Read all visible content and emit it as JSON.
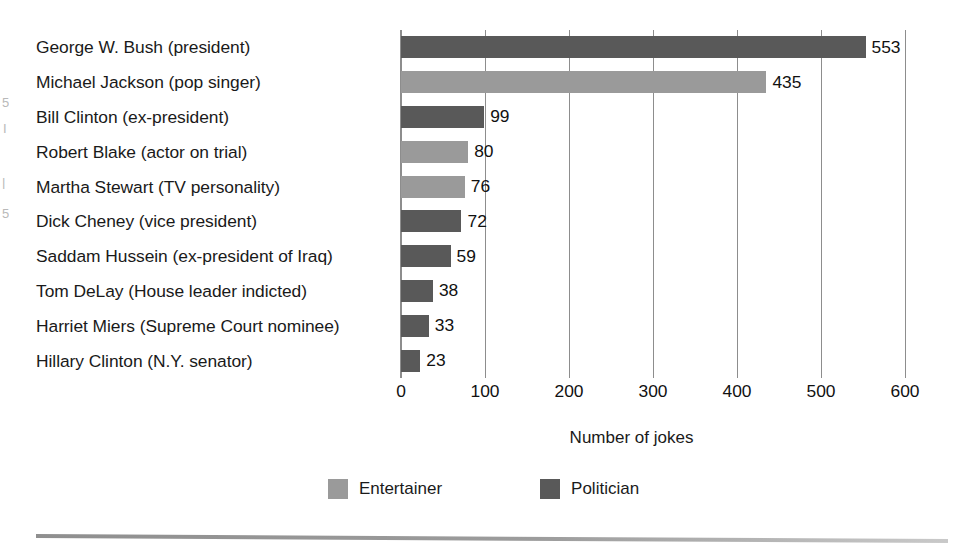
{
  "chart_data": {
    "type": "bar",
    "orientation": "horizontal",
    "title": "",
    "xlabel": "Number of jokes",
    "ylabel": "",
    "xlim": [
      0,
      600
    ],
    "xticks": [
      0,
      100,
      200,
      300,
      400,
      500,
      600
    ],
    "grid": true,
    "legend_position": "bottom-center",
    "categories": [
      "George W. Bush (president)",
      "Michael Jackson (pop singer)",
      "Bill Clinton (ex-president)",
      "Robert Blake (actor on trial)",
      "Martha Stewart (TV personality)",
      "Dick Cheney (vice president)",
      "Saddam Hussein (ex-president of Iraq)",
      "Tom DeLay (House leader indicted)",
      "Harriet Miers (Supreme Court nominee)",
      "Hillary Clinton (N.Y. senator)"
    ],
    "values": [
      553,
      435,
      99,
      80,
      76,
      72,
      59,
      38,
      33,
      23
    ],
    "groups": [
      "Politician",
      "Entertainer",
      "Politician",
      "Entertainer",
      "Entertainer",
      "Politician",
      "Politician",
      "Politician",
      "Politician",
      "Politician"
    ],
    "bars": [
      {
        "label": "George W. Bush (president)",
        "value": 553,
        "value_text": "553",
        "group": "Politician"
      },
      {
        "label": "Michael Jackson (pop singer)",
        "value": 435,
        "value_text": "435",
        "group": "Entertainer"
      },
      {
        "label": "Bill Clinton (ex-president)",
        "value": 99,
        "value_text": "99",
        "group": "Politician"
      },
      {
        "label": "Robert Blake (actor on trial)",
        "value": 80,
        "value_text": "80",
        "group": "Entertainer"
      },
      {
        "label": "Martha Stewart (TV personality)",
        "value": 76,
        "value_text": "76",
        "group": "Entertainer"
      },
      {
        "label": "Dick Cheney (vice president)",
        "value": 72,
        "value_text": "72",
        "group": "Politician"
      },
      {
        "label": "Saddam Hussein (ex-president of Iraq)",
        "value": 59,
        "value_text": "59",
        "group": "Politician"
      },
      {
        "label": "Tom DeLay (House leader indicted)",
        "value": 38,
        "value_text": "38",
        "group": "Politician"
      },
      {
        "label": "Harriet Miers (Supreme Court nominee)",
        "value": 33,
        "value_text": "33",
        "group": "Politician"
      },
      {
        "label": "Hillary Clinton (N.Y. senator)",
        "value": 23,
        "value_text": "23",
        "group": "Politician"
      }
    ],
    "legend": [
      {
        "label": "Entertainer",
        "color": "#9a9a9a"
      },
      {
        "label": "Politician",
        "color": "#595959"
      }
    ],
    "tick_labels": [
      "0",
      "100",
      "200",
      "300",
      "400",
      "500",
      "600"
    ],
    "colors": {
      "entertainer": "#9a9a9a",
      "politician": "#595959",
      "gridline": "#8d8d8d",
      "text": "#1a1a1a",
      "background": "#ffffff"
    }
  },
  "scan_artifacts": [
    {
      "text": "5",
      "x": 2,
      "y": 96
    },
    {
      "text": "I",
      "x": 3,
      "y": 122
    },
    {
      "text": "|",
      "x": 2,
      "y": 176
    },
    {
      "text": "5",
      "x": 2,
      "y": 207
    }
  ]
}
